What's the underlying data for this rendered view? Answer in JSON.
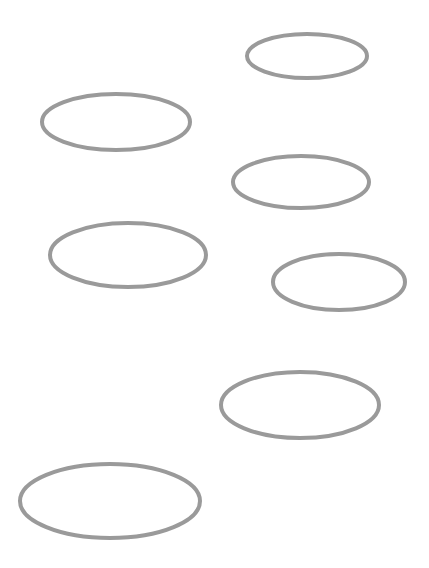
{
  "canvas": {
    "width": 429,
    "height": 568,
    "background": "#ffffff"
  },
  "style": {
    "stroke_color": "#9a9a9a",
    "stroke_width": 4
  },
  "shapes": [
    {
      "type": "ellipse",
      "cx": 307,
      "cy": 56,
      "rx": 60,
      "ry": 22
    },
    {
      "type": "ellipse",
      "cx": 116,
      "cy": 122,
      "rx": 74,
      "ry": 28
    },
    {
      "type": "ellipse",
      "cx": 301,
      "cy": 182,
      "rx": 68,
      "ry": 26
    },
    {
      "type": "ellipse",
      "cx": 128,
      "cy": 255,
      "rx": 78,
      "ry": 32
    },
    {
      "type": "ellipse",
      "cx": 339,
      "cy": 282,
      "rx": 66,
      "ry": 28
    },
    {
      "type": "ellipse",
      "cx": 300,
      "cy": 405,
      "rx": 79,
      "ry": 33
    },
    {
      "type": "ellipse",
      "cx": 110,
      "cy": 501,
      "rx": 90,
      "ry": 37
    }
  ]
}
